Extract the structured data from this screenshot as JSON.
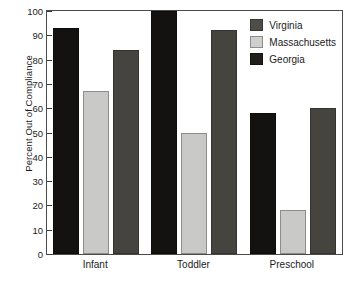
{
  "chart_data": {
    "type": "bar",
    "title": "",
    "xlabel": "",
    "ylabel": "Percent Out of Compliance",
    "categories": [
      "Infant",
      "Toddler",
      "Preschool"
    ],
    "series": [
      {
        "name": "Virginia",
        "color": "#141210",
        "values": [
          93,
          100,
          58
        ]
      },
      {
        "name": "Massachusetts",
        "color": "#c9c9c7",
        "values": [
          67,
          50,
          18
        ]
      },
      {
        "name": "Georgia",
        "color": "#46443f",
        "values": [
          84,
          92,
          60
        ]
      }
    ],
    "ylim": [
      0,
      100
    ],
    "yticks": [
      0,
      10,
      20,
      30,
      40,
      50,
      60,
      70,
      80,
      90,
      100
    ],
    "ytick_labels": [
      "0",
      "10",
      "20",
      "30",
      "40",
      "50",
      "60",
      "70",
      "80",
      "90",
      "100"
    ],
    "grid": false,
    "legend_position": "top-right",
    "legend_entries": [
      "Virginia",
      "Massachusetts",
      "Georgia"
    ]
  }
}
